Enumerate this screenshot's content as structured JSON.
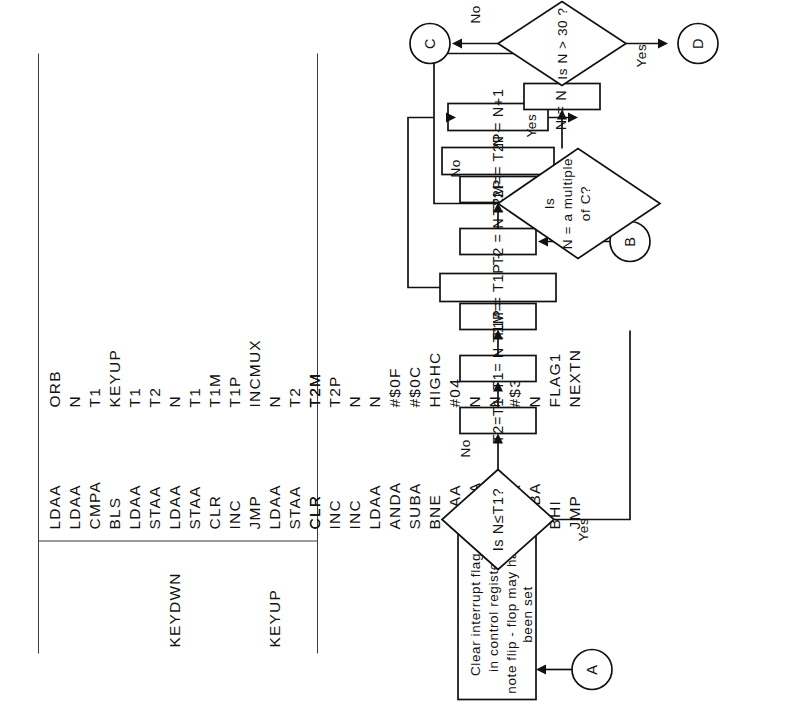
{
  "listing": {
    "columns": [
      "label",
      "mnemonic",
      "operand"
    ],
    "rows": [
      {
        "label": "",
        "mnemonic": "LDAA",
        "operand": "ORB"
      },
      {
        "label": "",
        "mnemonic": "LDAA",
        "operand": "N"
      },
      {
        "label": "",
        "mnemonic": "CMPA",
        "operand": "T1"
      },
      {
        "label": "",
        "mnemonic": "BLS",
        "operand": "KEYUP"
      },
      {
        "label": "",
        "mnemonic": "LDAA",
        "operand": "T1"
      },
      {
        "label": "",
        "mnemonic": "STAA",
        "operand": "T2"
      },
      {
        "label": "KEYDWN",
        "mnemonic": "LDAA",
        "operand": "N"
      },
      {
        "label": "",
        "mnemonic": "STAA",
        "operand": "T1"
      },
      {
        "label": "",
        "mnemonic": "CLR",
        "operand": "T1M"
      },
      {
        "label": "",
        "mnemonic": "INC",
        "operand": "T1P"
      },
      {
        "label": "",
        "mnemonic": "JMP",
        "operand": "INCMUX"
      },
      {
        "label": "KEYUP",
        "mnemonic": "LDAA",
        "operand": "N"
      },
      {
        "label": "",
        "mnemonic": "STAA",
        "operand": "T2"
      },
      {
        "label": "",
        "mnemonic": "CLR",
        "operand": "T2M"
      },
      {
        "label": "",
        "mnemonic": "INC",
        "operand": "T2P"
      },
      {
        "label": "",
        "mnemonic": "INC",
        "operand": "N"
      },
      {
        "label": "",
        "mnemonic": "LDAA",
        "operand": "N"
      },
      {
        "label": "",
        "mnemonic": "ANDA",
        "operand": "#$0F"
      },
      {
        "label": "",
        "mnemonic": "SUBA",
        "operand": "#$0C"
      },
      {
        "label": "",
        "mnemonic": "BNE",
        "operand": "HIGHC"
      },
      {
        "label": "",
        "mnemonic": "LDAA",
        "operand": "#04"
      },
      {
        "label": "",
        "mnemonic": "ADDA",
        "operand": "N"
      },
      {
        "label": "",
        "mnemonic": "STAA",
        "operand": "N"
      },
      {
        "label": "HIGHC",
        "mnemonic": "LDAA",
        "operand": "#$30"
      },
      {
        "label": "",
        "mnemonic": "SUBA",
        "operand": "N"
      },
      {
        "label": "",
        "mnemonic": "BHI",
        "operand": "FLAG1"
      },
      {
        "label": "",
        "mnemonic": "JMP",
        "operand": "NEXTN"
      }
    ]
  },
  "flowchart": {
    "terminals": {
      "a": "A",
      "b": "B",
      "c": "C",
      "d": "D"
    },
    "process_start": {
      "line1": "Clear interrupt flag",
      "line2": "in control register",
      "line3": "note flip - flop may have",
      "line4": "been set"
    },
    "decision1": {
      "text": "Is  N≤T1?",
      "yes": "Yes",
      "no": "No"
    },
    "boxes": {
      "t2_eq_t1": "T2=T1",
      "t1_eq_n": "T1= N",
      "t1m_eq_0": "T1M=O",
      "t1p_inc": "T1P = T1P + 1",
      "t2_eq_n": "T2 = N",
      "t2m_eq_0": "T2M=O",
      "t2p_inc": "T2P = T2P+1",
      "n_inc": "N = N+1",
      "n_plus_4": "N = N + 4"
    },
    "decision2": {
      "line1": "Is",
      "line2": "N = a multiple",
      "line3": "of C?",
      "yes": "Yes",
      "no": "No"
    },
    "decision3": {
      "text": "Is N > 30 ?",
      "yes": "Yes",
      "no": "No"
    }
  }
}
